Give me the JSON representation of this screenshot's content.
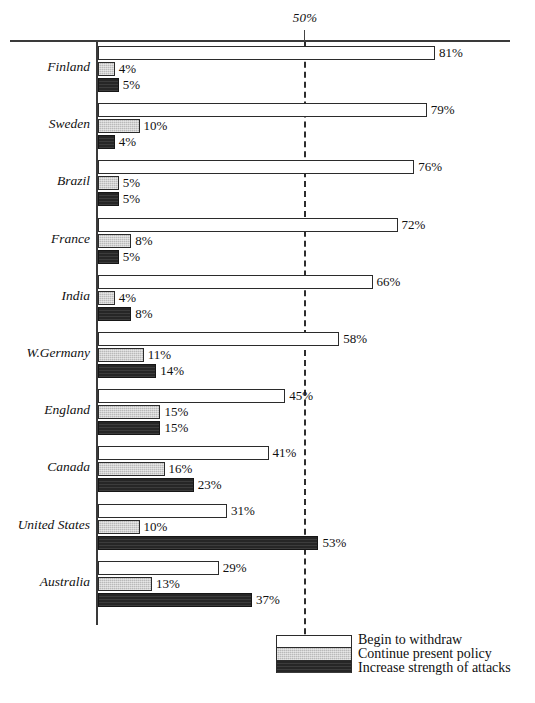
{
  "chart_data": {
    "type": "bar",
    "orientation": "horizontal",
    "title": "",
    "subtitle": "",
    "xlabel": "",
    "ylabel": "",
    "xlim": [
      0,
      100
    ],
    "grid": false,
    "reference_line": {
      "value": 50,
      "label": "50%",
      "style": "dashed"
    },
    "axis_ticks": [
      "50%"
    ],
    "legend": {
      "position": "bottom-right"
    },
    "categories": [
      "Finland",
      "Sweden",
      "Brazil",
      "France",
      "India",
      "W.Germany",
      "England",
      "Canada",
      "United States",
      "Australia"
    ],
    "series": [
      {
        "name": "Begin to withdraw",
        "color": "#ffffff",
        "values": [
          81,
          79,
          76,
          72,
          66,
          58,
          45,
          41,
          31,
          29
        ],
        "labels": [
          "81%",
          "79%",
          "76%",
          "72%",
          "66%",
          "58%",
          "45%",
          "41%",
          "31%",
          "29%"
        ]
      },
      {
        "name": "Continue present policy",
        "color": "#b9b9b9",
        "values": [
          4,
          10,
          5,
          8,
          4,
          11,
          15,
          16,
          10,
          13
        ],
        "labels": [
          "4%",
          "10%",
          "5%",
          "8%",
          "4%",
          "11%",
          "15%",
          "16%",
          "10%",
          "13%"
        ]
      },
      {
        "name": "Increase strength of attacks",
        "color": "#262626",
        "values": [
          5,
          4,
          5,
          5,
          8,
          14,
          15,
          23,
          53,
          37
        ],
        "labels": [
          "5%",
          "4%",
          "5%",
          "5%",
          "8%",
          "14%",
          "15%",
          "23%",
          "53%",
          "37%"
        ]
      }
    ]
  },
  "legend": {
    "items": [
      {
        "label": "Begin to withdraw",
        "swatch": "white-swatch"
      },
      {
        "label": "Continue present policy",
        "swatch": "gray-swatch"
      },
      {
        "label": "Increase strength of attacks",
        "swatch": "black-swatch"
      }
    ]
  }
}
